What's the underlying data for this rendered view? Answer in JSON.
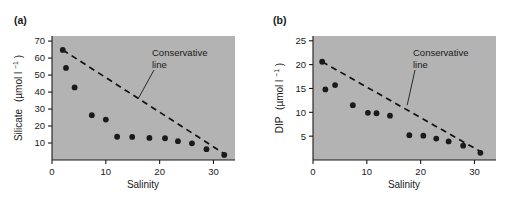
{
  "figure": {
    "background_color": "#ffffff",
    "plot_background_color": "#b3b3b3",
    "marker_color": "#1a1a1a",
    "line_color": "#111111"
  },
  "panels": [
    {
      "label": "(a)",
      "panel_id": "a",
      "chart_data": {
        "type": "scatter",
        "title": "",
        "xlabel": "Salinity",
        "ylabel": "Silicate (µmol l⁻¹)",
        "ylabel_main": "Silicate",
        "ylabel_unit_base": "(µmol l",
        "ylabel_unit_exp": "−1",
        "ylabel_unit_close": ")",
        "xlim": [
          0,
          34
        ],
        "ylim": [
          0,
          73
        ],
        "xticks": [
          0,
          10,
          20,
          30
        ],
        "yticks": [
          10,
          20,
          30,
          40,
          50,
          60,
          70
        ],
        "grid": false,
        "legend": "none",
        "series": [
          {
            "name": "Silicate observations",
            "marker": "filled-circle",
            "points": [
              {
                "x": 2.0,
                "y": 64.8
              },
              {
                "x": 2.6,
                "y": 54.2
              },
              {
                "x": 4.2,
                "y": 42.7
              },
              {
                "x": 7.4,
                "y": 26.4
              },
              {
                "x": 10.0,
                "y": 23.8
              },
              {
                "x": 12.1,
                "y": 13.7
              },
              {
                "x": 14.9,
                "y": 13.6
              },
              {
                "x": 18.1,
                "y": 13.0
              },
              {
                "x": 21.0,
                "y": 12.8
              },
              {
                "x": 23.4,
                "y": 11.1
              },
              {
                "x": 26.0,
                "y": 9.8
              },
              {
                "x": 28.7,
                "y": 6.4
              },
              {
                "x": 32.0,
                "y": 3.0
              }
            ]
          }
        ],
        "reference_line": {
          "name": "Conservative line",
          "style": "dashed",
          "x_start": 2.0,
          "y_start": 64.8,
          "x_end": 32.6,
          "y_end": 2.5
        },
        "annotations": [
          {
            "text_line1": "Conservative",
            "text_line2": "line",
            "text": "Conservative line",
            "target_x": 16.0,
            "target_y": 36.0
          }
        ]
      }
    },
    {
      "label": "(b)",
      "panel_id": "b",
      "chart_data": {
        "type": "scatter",
        "title": "",
        "xlabel": "Salinity",
        "ylabel": "DIP (µmol l⁻¹)",
        "ylabel_main": "DIP",
        "ylabel_unit_base": "(µmol l",
        "ylabel_unit_exp": "−1",
        "ylabel_unit_close": ")",
        "xlim": [
          0,
          34
        ],
        "ylim": [
          0,
          26
        ],
        "xticks": [
          0,
          10,
          20,
          30
        ],
        "yticks": [
          5,
          10,
          15,
          20,
          25
        ],
        "grid": false,
        "legend": "none",
        "series": [
          {
            "name": "DIP observations",
            "marker": "filled-circle",
            "points": [
              {
                "x": 1.7,
                "y": 20.6
              },
              {
                "x": 2.3,
                "y": 14.8
              },
              {
                "x": 4.1,
                "y": 15.7
              },
              {
                "x": 7.4,
                "y": 11.5
              },
              {
                "x": 10.2,
                "y": 9.9
              },
              {
                "x": 11.8,
                "y": 9.8
              },
              {
                "x": 14.3,
                "y": 9.3
              },
              {
                "x": 17.9,
                "y": 5.2
              },
              {
                "x": 20.5,
                "y": 5.1
              },
              {
                "x": 22.9,
                "y": 4.5
              },
              {
                "x": 25.2,
                "y": 3.9
              },
              {
                "x": 27.9,
                "y": 3.0
              },
              {
                "x": 31.1,
                "y": 1.5
              }
            ]
          }
        ],
        "reference_line": {
          "name": "Conservative line",
          "style": "dashed",
          "x_start": 1.7,
          "y_start": 20.6,
          "x_end": 32.0,
          "y_end": 1.2
        },
        "annotations": [
          {
            "text_line1": "Conservative",
            "text_line2": "line",
            "text": "Conservative line",
            "target_x": 17.5,
            "target_y": 11.5
          }
        ]
      }
    }
  ]
}
